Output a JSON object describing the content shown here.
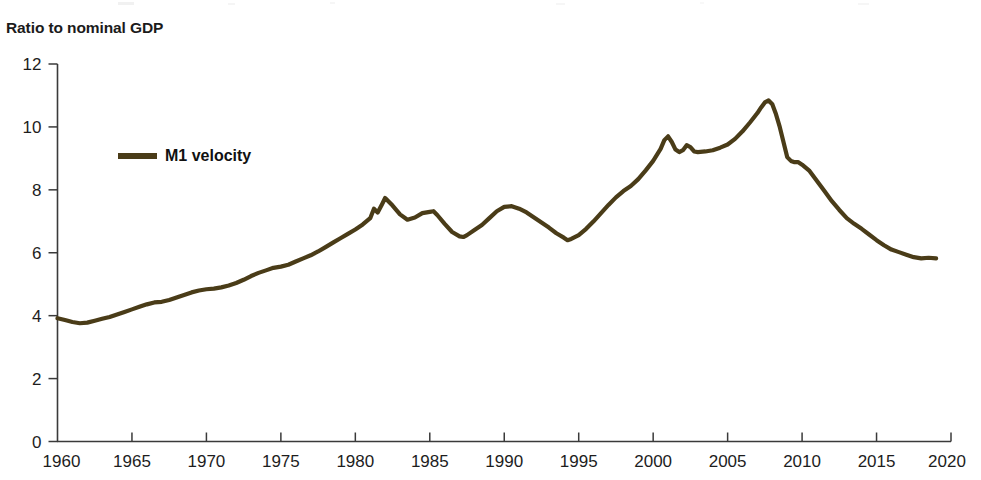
{
  "axis_title": "Ratio to nominal GDP",
  "legend": {
    "entries": [
      {
        "label": "M1 velocity",
        "color": "#4a3c18"
      }
    ]
  },
  "colors": {
    "series_brown": "#4a3c18",
    "axis_gray": "#3a3a3a",
    "text_black": "#1d1d1d",
    "background": "#ffffff"
  },
  "chart_data": {
    "type": "line",
    "title": "",
    "subtitle": "",
    "xlabel": "",
    "ylabel": "Ratio to nominal GDP",
    "xlim": [
      1960,
      2020
    ],
    "ylim": [
      0,
      12
    ],
    "xticks": [
      1960,
      1965,
      1970,
      1975,
      1980,
      1985,
      1990,
      1995,
      2000,
      2005,
      2010,
      2015,
      2020
    ],
    "yticks": [
      0,
      2,
      4,
      6,
      8,
      10,
      12
    ],
    "grid": false,
    "legend_position": "upper-left-inside",
    "series": [
      {
        "name": "M1 velocity",
        "color": "#4a3c18",
        "x": [
          1960.0,
          1960.5,
          1961.0,
          1961.5,
          1962.0,
          1962.5,
          1963.0,
          1963.5,
          1964.0,
          1964.5,
          1965.0,
          1965.5,
          1966.0,
          1966.5,
          1967.0,
          1967.5,
          1968.0,
          1968.5,
          1969.0,
          1969.5,
          1970.0,
          1970.5,
          1971.0,
          1971.5,
          1972.0,
          1972.5,
          1973.0,
          1973.5,
          1974.0,
          1974.5,
          1975.0,
          1975.5,
          1976.0,
          1976.5,
          1977.0,
          1977.5,
          1978.0,
          1978.5,
          1979.0,
          1979.5,
          1980.0,
          1980.5,
          1981.0,
          1981.25,
          1981.5,
          1981.75,
          1982.0,
          1982.5,
          1983.0,
          1983.5,
          1984.0,
          1984.5,
          1985.0,
          1985.25,
          1985.5,
          1986.0,
          1986.5,
          1987.0,
          1987.25,
          1987.5,
          1988.0,
          1988.5,
          1989.0,
          1989.5,
          1990.0,
          1990.5,
          1991.0,
          1991.5,
          1992.0,
          1992.5,
          1993.0,
          1993.5,
          1994.0,
          1994.25,
          1994.5,
          1995.0,
          1995.5,
          1996.0,
          1996.5,
          1997.0,
          1997.5,
          1998.0,
          1998.5,
          1999.0,
          1999.5,
          2000.0,
          2000.5,
          2000.75,
          2001.0,
          2001.25,
          2001.5,
          2001.75,
          2002.0,
          2002.25,
          2002.5,
          2002.75,
          2003.0,
          2003.5,
          2004.0,
          2004.5,
          2005.0,
          2005.5,
          2006.0,
          2006.5,
          2007.0,
          2007.25,
          2007.5,
          2007.75,
          2008.0,
          2008.25,
          2008.5,
          2008.75,
          2009.0,
          2009.25,
          2009.5,
          2009.75,
          2010.0,
          2010.5,
          2011.0,
          2011.5,
          2012.0,
          2012.5,
          2013.0,
          2013.5,
          2014.0,
          2014.5,
          2015.0,
          2015.5,
          2016.0,
          2016.5,
          2017.0,
          2017.5,
          2018.0,
          2018.5,
          2019.0
        ],
        "y": [
          3.92,
          3.86,
          3.8,
          3.76,
          3.78,
          3.84,
          3.9,
          3.96,
          4.04,
          4.12,
          4.2,
          4.28,
          4.36,
          4.42,
          4.44,
          4.5,
          4.58,
          4.66,
          4.74,
          4.8,
          4.84,
          4.86,
          4.9,
          4.96,
          5.04,
          5.14,
          5.26,
          5.36,
          5.44,
          5.52,
          5.56,
          5.62,
          5.72,
          5.82,
          5.92,
          6.04,
          6.18,
          6.32,
          6.46,
          6.6,
          6.74,
          6.9,
          7.1,
          7.4,
          7.28,
          7.5,
          7.74,
          7.5,
          7.22,
          7.05,
          7.12,
          7.26,
          7.3,
          7.32,
          7.2,
          6.92,
          6.66,
          6.52,
          6.5,
          6.56,
          6.72,
          6.88,
          7.1,
          7.32,
          7.46,
          7.48,
          7.4,
          7.28,
          7.12,
          6.96,
          6.8,
          6.62,
          6.48,
          6.4,
          6.44,
          6.56,
          6.76,
          7.0,
          7.26,
          7.52,
          7.76,
          7.96,
          8.12,
          8.34,
          8.62,
          8.92,
          9.3,
          9.58,
          9.7,
          9.52,
          9.28,
          9.2,
          9.26,
          9.42,
          9.36,
          9.22,
          9.2,
          9.22,
          9.26,
          9.34,
          9.44,
          9.62,
          9.86,
          10.14,
          10.44,
          10.62,
          10.78,
          10.84,
          10.72,
          10.4,
          10.0,
          9.52,
          9.04,
          8.92,
          8.88,
          8.88,
          8.8,
          8.6,
          8.28,
          7.96,
          7.64,
          7.36,
          7.1,
          6.92,
          6.76,
          6.58,
          6.4,
          6.24,
          6.1,
          6.02,
          5.94,
          5.86,
          5.82,
          5.84,
          5.82
        ]
      }
    ]
  }
}
